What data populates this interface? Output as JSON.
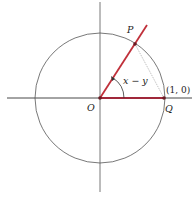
{
  "diagram": {
    "type": "unit-circle-angle",
    "labels": {
      "origin": "O",
      "point_p": "P",
      "point_q": "Q",
      "angle": "x − y",
      "coordinate_q": "(1, 0)"
    },
    "colors": {
      "axis": "#333333",
      "circle": "#555555",
      "ray": "#c0303a",
      "chord": "#999999",
      "point": "#6a1a22"
    }
  }
}
